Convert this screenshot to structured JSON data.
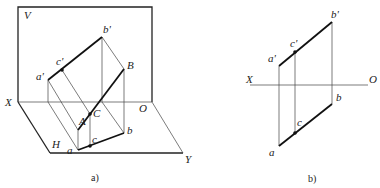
{
  "figure_a": {
    "caption": "a)",
    "plane_labels": {
      "V": "V",
      "H": "H",
      "X": "X",
      "O": "O",
      "Y": "Y"
    },
    "point_labels": {
      "a_prime": "a'",
      "b_prime": "b'",
      "c_prime": "c'",
      "A": "A",
      "B": "B",
      "C": "C",
      "a": "a",
      "b": "b",
      "c": "c"
    }
  },
  "figure_b": {
    "caption": "b)",
    "axis_labels": {
      "X": "X",
      "O": "O"
    },
    "point_labels": {
      "a_prime": "a'",
      "b_prime": "b'",
      "c_prime": "c'",
      "a": "a",
      "b": "b",
      "c": "c"
    }
  },
  "colors": {
    "line": "#111111",
    "thin_line": "#444444",
    "background": "#ffffff"
  }
}
